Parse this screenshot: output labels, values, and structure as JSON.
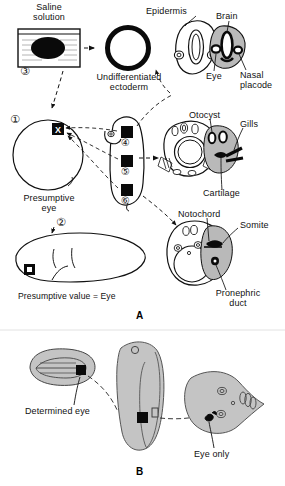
{
  "figure": {
    "panels": [
      {
        "id": "A",
        "letter": "A"
      },
      {
        "id": "B",
        "letter": "B"
      }
    ]
  },
  "panelA": {
    "letter": "A",
    "steps": [
      {
        "number": "1",
        "glyph": "①",
        "meaning": "presumptive-eye-region-marked-on-blastula"
      },
      {
        "number": "2",
        "glyph": "②",
        "meaning": "presumptive-eye-region-on-neurula"
      },
      {
        "number": "3",
        "glyph": "③",
        "meaning": "explant-cultured-in-saline-solution"
      },
      {
        "number": "4",
        "glyph": "④",
        "meaning": "graft-site-anterior-head"
      },
      {
        "number": "5",
        "glyph": "⑤",
        "meaning": "graft-site-mid-trunk"
      },
      {
        "number": "6",
        "glyph": "⑥",
        "meaning": "graft-site-posterior-trunk"
      }
    ],
    "labels": {
      "saline_solution_line1": "Saline",
      "saline_solution_line2": "solution",
      "undifferentiated_line1": "Undifferentiated",
      "undifferentiated_line2": "ectoderm",
      "epidermis": "Epidermis",
      "brain": "Brain",
      "eye": "Eye",
      "nasal_placode_line1": "Nasal",
      "nasal_placode_line2": "placode",
      "otocyst": "Otocyst",
      "gills": "Gills",
      "cartilage": "Cartilage",
      "notochord": "Notochord",
      "somite": "Somite",
      "pronephric_duct_line1": "Pronephric",
      "pronephric_duct_line2": "duct",
      "presumptive_eye_line1": "Presumptive",
      "presumptive_eye_line2": "eye",
      "presumptive_value": "Presumptive value = Eye",
      "graft_marker": "X"
    }
  },
  "panelB": {
    "letter": "B",
    "labels": {
      "determined_eye": "Determined eye",
      "eye_only": "Eye only"
    }
  },
  "colors": {
    "ink": "#111111",
    "paper": "#ffffff",
    "tissue_fill": "#b9b9b9",
    "tissue_fill_light": "#c9c9c9",
    "graft_black": "#0a0a0a",
    "outline": "#1a1a1a"
  }
}
